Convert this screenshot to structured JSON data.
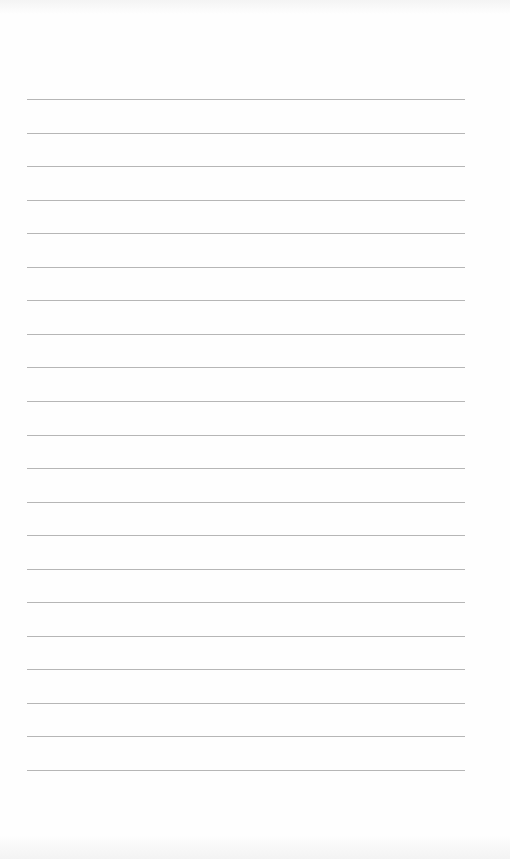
{
  "page": {
    "type": "blank lined notebook page",
    "background_color": "#fefefe",
    "line_color": "#a9a9a9",
    "lines": {
      "count": 21,
      "first_y": 99,
      "spacing": 33.55,
      "left": 27,
      "width": 438
    }
  }
}
